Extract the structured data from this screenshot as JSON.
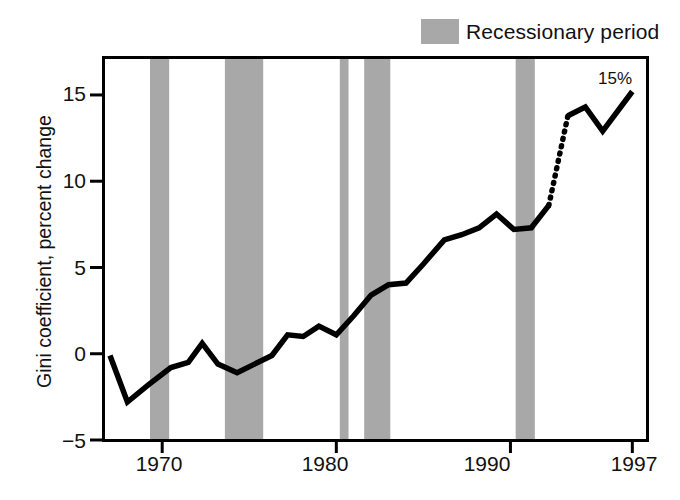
{
  "chart_data": {
    "type": "line",
    "title": "",
    "xlabel": "",
    "ylabel": "Gini coefficient, percent change",
    "xlim": [
      1966.6,
      1997.9
    ],
    "ylim": [
      -5,
      17.2
    ],
    "yticks": [
      -5,
      0,
      5,
      10,
      15
    ],
    "ytick_labels": [
      "−5",
      "0",
      "5",
      "10",
      "15"
    ],
    "xticks": [
      1970,
      1980,
      1990,
      1997
    ],
    "xtick_labels": [
      "1970",
      "1980",
      "1990",
      "1997"
    ],
    "grid": false,
    "legend": {
      "position": "top-right",
      "entries": [
        {
          "label": "Recessionary period",
          "swatch_color": "#a8a8a8",
          "type": "band"
        }
      ]
    },
    "annotations": [
      {
        "text": "15%",
        "x": 1996.2,
        "y": 16.1
      }
    ],
    "series": [
      {
        "name": "Gini coefficient, percent change",
        "style": "solid",
        "color": "#000000",
        "x": [
          1967.0,
          1968.0,
          1969.2,
          1970.5,
          1971.5,
          1972.3,
          1973.2,
          1974.3,
          1975.3,
          1976.3,
          1977.2,
          1978.1,
          1979.0,
          1980.0,
          1981.0,
          1982.0,
          1983.0,
          1984.0,
          1985.0,
          1986.2,
          1987.2,
          1988.2,
          1989.2,
          1990.2,
          1991.2,
          1992.2
        ],
        "values": [
          -0.1,
          -2.8,
          -1.8,
          -0.8,
          -0.5,
          0.6,
          -0.6,
          -1.1,
          -0.6,
          -0.1,
          1.1,
          1.0,
          1.6,
          1.1,
          2.2,
          3.4,
          4.0,
          4.1,
          5.2,
          6.6,
          6.9,
          7.3,
          8.1,
          7.2,
          7.3,
          8.6
        ]
      },
      {
        "name": "Gini coefficient, percent change (break in series)",
        "style": "dotted",
        "color": "#000000",
        "x": [
          1992.2,
          1993.3
        ],
        "values": [
          8.6,
          13.8
        ]
      },
      {
        "name": "Gini coefficient, percent change (post-revision)",
        "style": "solid",
        "color": "#000000",
        "x": [
          1993.3,
          1994.3,
          1995.3,
          1997.0
        ],
        "values": [
          13.8,
          14.3,
          12.9,
          15.2
        ]
      }
    ],
    "recession_bands": [
      {
        "start": 1969.3,
        "end": 1970.4
      },
      {
        "start": 1973.6,
        "end": 1975.8
      },
      {
        "start": 1980.2,
        "end": 1980.7
      },
      {
        "start": 1981.6,
        "end": 1983.1
      },
      {
        "start": 1990.3,
        "end": 1991.4
      }
    ],
    "band_color": "#a8a8a8",
    "axis_color": "#000000",
    "line_color": "#000000"
  }
}
